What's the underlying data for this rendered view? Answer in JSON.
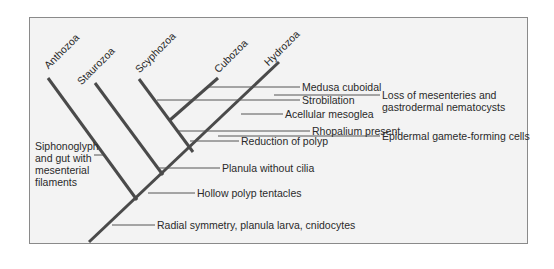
{
  "diagram": {
    "type": "cladogram",
    "taxa": [
      {
        "name": "Anthozoa"
      },
      {
        "name": "Staurozoa"
      },
      {
        "name": "Scyphozoa"
      },
      {
        "name": "Cubozoa"
      },
      {
        "name": "Hydrozoa"
      }
    ],
    "characters": [
      {
        "label": "Medusa cuboidal"
      },
      {
        "label": "Strobilation"
      },
      {
        "label": "Acellular mesoglea"
      },
      {
        "label": "Rhopalium present"
      },
      {
        "label": "Reduction of polyp"
      },
      {
        "label": "Planula without cilia"
      },
      {
        "label": "Hollow polyp tentacles"
      },
      {
        "label": "Radial symmetry, planula larva, cnidocytes"
      },
      {
        "label": "Loss of mesenteries and gastrodermal nematocysts",
        "line1": "Loss of mesenteries and",
        "line2": "gastrodermal nematocysts"
      },
      {
        "label": "Epidermal gamete-forming cells"
      },
      {
        "label": "Siphonoglyph and gut with mesenterial filaments",
        "line1": "Siphonoglyph",
        "line2": "and gut with",
        "line3": "mesenterial",
        "line4": "filaments"
      }
    ],
    "colors": {
      "branch": "#4a4a4a",
      "leader": "#555555",
      "text": "#2a2a2a",
      "frame": "#8a8a8a",
      "background": "#f3f3f3"
    }
  }
}
